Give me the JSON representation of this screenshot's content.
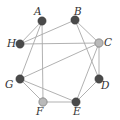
{
  "diagram": {
    "type": "graph",
    "nodes": [
      {
        "id": "A",
        "label": "A",
        "x": 42,
        "y": 21,
        "color": "#4a4a4a",
        "lx": 34,
        "ly": 15
      },
      {
        "id": "B",
        "label": "B",
        "x": 75,
        "y": 20,
        "color": "#4a4a4a",
        "lx": 74,
        "ly": 15
      },
      {
        "id": "C",
        "label": "C",
        "x": 99,
        "y": 43,
        "color": "#b9b9b9",
        "lx": 104,
        "ly": 46
      },
      {
        "id": "D",
        "label": "D",
        "x": 99,
        "y": 79,
        "color": "#4a4a4a",
        "lx": 101,
        "ly": 89
      },
      {
        "id": "E",
        "label": "E",
        "x": 76,
        "y": 102,
        "color": "#4a4a4a",
        "lx": 73,
        "ly": 115
      },
      {
        "id": "F",
        "label": "F",
        "x": 43,
        "y": 102,
        "color": "#b9b9b9",
        "lx": 36,
        "ly": 115
      },
      {
        "id": "G",
        "label": "G",
        "x": 20,
        "y": 79,
        "color": "#4a4a4a",
        "lx": 5,
        "ly": 88
      },
      {
        "id": "H",
        "label": "H",
        "x": 20,
        "y": 44,
        "color": "#4a4a4a",
        "lx": 7,
        "ly": 47
      }
    ],
    "edges": [
      [
        "A",
        "H"
      ],
      [
        "A",
        "G"
      ],
      [
        "A",
        "F"
      ],
      [
        "B",
        "H"
      ],
      [
        "B",
        "C"
      ],
      [
        "B",
        "D"
      ],
      [
        "H",
        "C"
      ],
      [
        "C",
        "D"
      ],
      [
        "C",
        "G"
      ],
      [
        "C",
        "E"
      ],
      [
        "D",
        "E"
      ],
      [
        "G",
        "F"
      ],
      [
        "G",
        "E"
      ],
      [
        "F",
        "E"
      ]
    ]
  }
}
